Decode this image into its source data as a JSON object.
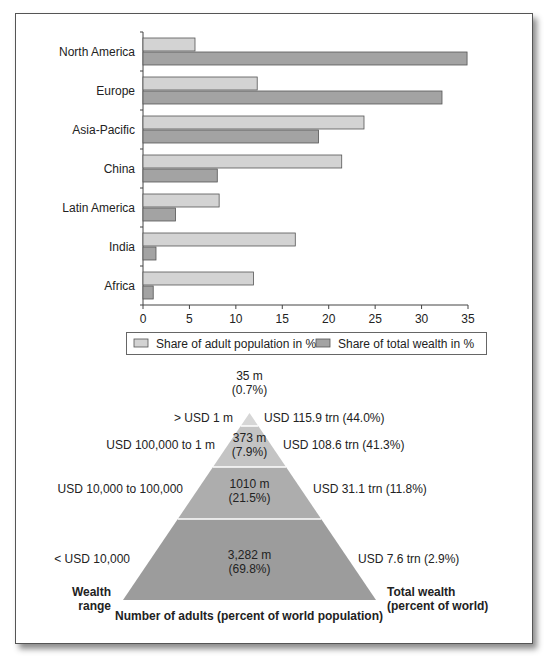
{
  "chart_data": [
    {
      "type": "bar",
      "orientation": "horizontal",
      "title": "",
      "categories": [
        "North America",
        "Europe",
        "Asia-Pacific",
        "China",
        "Latin America",
        "India",
        "Africa"
      ],
      "series": [
        {
          "name": "Share of adult population in %",
          "color": "#d3d3d3",
          "values": [
            5.6,
            12.3,
            23.8,
            21.4,
            8.2,
            16.4,
            11.9
          ]
        },
        {
          "name": "Share of total wealth in %",
          "color": "#a3a3a3",
          "values": [
            34.9,
            32.2,
            18.9,
            8.0,
            3.5,
            1.4,
            1.1
          ]
        }
      ],
      "xlabel": "",
      "ylabel": "",
      "xlim": [
        0,
        35
      ],
      "xticks": [
        0,
        5,
        10,
        15,
        20,
        25,
        30,
        35
      ],
      "grid": false,
      "legend_position": "bottom"
    },
    {
      "type": "pyramid",
      "title": "",
      "tiers": [
        {
          "wealth_range": "> USD 1 m",
          "adults": "35 m",
          "adults_pct": "(0.7%)",
          "total_wealth": "USD 115.9 trn (44.0%)",
          "color": "#d6d6d6"
        },
        {
          "wealth_range": "USD 100,000 to 1 m",
          "adults": "373 m",
          "adults_pct": "(7.9%)",
          "total_wealth": "USD 108.6 trn (41.3%)",
          "color": "#c4c4c4"
        },
        {
          "wealth_range": "USD 10,000 to 100,000",
          "adults": "1010 m",
          "adults_pct": "(21.5%)",
          "total_wealth": "USD 31.1 trn (11.8%)",
          "color": "#adadad"
        },
        {
          "wealth_range": "< USD 10,000",
          "adults": "3,282 m",
          "adults_pct": "(69.8%)",
          "total_wealth": "USD 7.6 trn (2.9%)",
          "color": "#9c9c9c"
        }
      ],
      "left_axis_label_line1": "Wealth",
      "left_axis_label_line2": "range",
      "right_axis_label_line1": "Total wealth",
      "right_axis_label_line2": "(percent of world)",
      "bottom_label": "Number of adults (percent of world population)"
    }
  ]
}
